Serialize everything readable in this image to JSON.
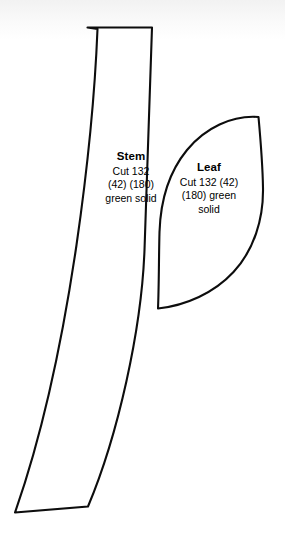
{
  "document": {
    "kind": "sewing-pattern-template",
    "background_color": "#ffffff",
    "ink_color": "#0d0d0d"
  },
  "pieces": [
    {
      "id": "stem",
      "name": "stem-piece",
      "title": "Stem",
      "lines": [
        "Cut 132",
        "(42) (180)",
        "green solid"
      ],
      "fabric": "green solid",
      "cut_counts": [
        "132",
        "(42)",
        "(180)"
      ]
    },
    {
      "id": "leaf",
      "name": "leaf-piece",
      "title": "Leaf",
      "lines": [
        "Cut 132 (42)",
        "(180) green",
        "solid"
      ],
      "fabric": "green solid",
      "cut_counts": [
        "132",
        "(42)",
        "(180)"
      ]
    }
  ],
  "shapes": {
    "stem_path": "M 87.5 27.5 L 152.0 27.5 C 150.0 90.0 147.5 170.0 144.5 250.0 C 141.5 330.0 118.0 435.0 88.0 506.5 L 15.0 512.5 C 44.0 430.0 64.0 330.0 76.5 245.0 C 88.5 162.0 95.0 92.0 97.5 29.0 Z",
    "leaf_path": "M 258.5 117.0 C 232.0 115.0 205.0 128.0 187.0 150.0 C 169.0 172.0 160.5 201.0 159.5 232.0 C 158.8 258.0 159.0 285.0 158.0 308.5 C 186.0 305.5 214.0 293.0 233.5 272.0 C 254.0 250.0 263.5 219.0 263.0 188.0 C 262.6 163.0 260.5 139.0 258.5 117.0 Z"
  }
}
